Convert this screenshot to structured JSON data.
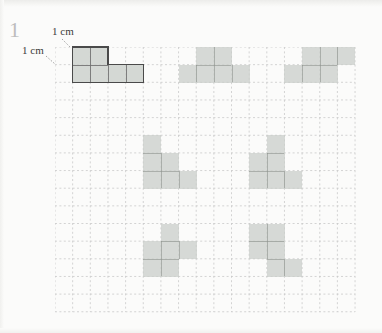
{
  "exercise": {
    "number": "1"
  },
  "labels": {
    "cm_top": "1 cm",
    "cm_left": "1 cm"
  },
  "grid": {
    "cell_px": 17.65,
    "cols": 17,
    "rows": 15,
    "origin_x": 55,
    "origin_y": 47,
    "line_color": "#c9c9c9",
    "line_style": "dashed"
  },
  "colors": {
    "shape_fill": "#c9cec9",
    "shape_seam": "#8d938d",
    "example_outline": "#4a4a4a",
    "number_color": "#bdbdbd",
    "paper": "#fbfbfa",
    "text": "#3b3b3b"
  },
  "shapes": [
    {
      "name": "shape-1-example",
      "outlined": true,
      "cells": [
        [
          1,
          0
        ],
        [
          2,
          0
        ],
        [
          1,
          1
        ],
        [
          2,
          1
        ],
        [
          3,
          1
        ],
        [
          4,
          1
        ]
      ]
    },
    {
      "name": "shape-2",
      "outlined": false,
      "cells": [
        [
          8,
          0
        ],
        [
          9,
          0
        ],
        [
          7,
          1
        ],
        [
          8,
          1
        ],
        [
          9,
          1
        ],
        [
          10,
          1
        ]
      ]
    },
    {
      "name": "shape-3",
      "outlined": false,
      "cells": [
        [
          14,
          0
        ],
        [
          15,
          0
        ],
        [
          16,
          0
        ],
        [
          13,
          1
        ],
        [
          14,
          1
        ],
        [
          15,
          1
        ]
      ]
    },
    {
      "name": "shape-4",
      "outlined": false,
      "cells": [
        [
          5,
          5
        ],
        [
          5,
          6
        ],
        [
          6,
          6
        ],
        [
          5,
          7
        ],
        [
          6,
          7
        ],
        [
          7,
          7
        ]
      ]
    },
    {
      "name": "shape-5",
      "outlined": false,
      "cells": [
        [
          12,
          5
        ],
        [
          11,
          6
        ],
        [
          12,
          6
        ],
        [
          11,
          7
        ],
        [
          12,
          7
        ],
        [
          13,
          7
        ]
      ]
    },
    {
      "name": "shape-6",
      "outlined": false,
      "cells": [
        [
          6,
          10
        ],
        [
          5,
          11
        ],
        [
          6,
          11
        ],
        [
          7,
          11
        ],
        [
          5,
          12
        ],
        [
          6,
          12
        ]
      ]
    },
    {
      "name": "shape-7",
      "outlined": false,
      "cells": [
        [
          11,
          10
        ],
        [
          12,
          10
        ],
        [
          11,
          11
        ],
        [
          12,
          11
        ],
        [
          12,
          12
        ],
        [
          13,
          12
        ]
      ]
    }
  ]
}
